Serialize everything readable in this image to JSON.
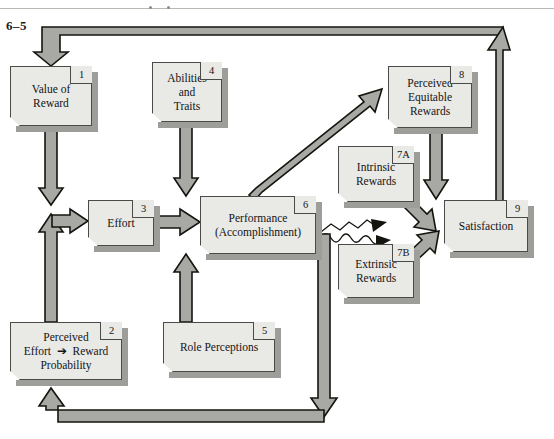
{
  "figure": {
    "number": "6–5"
  },
  "nodes": [
    {
      "id": "n1",
      "num": "1",
      "label": "Value of\nReward",
      "x": 10,
      "y": 66,
      "w": 82,
      "h": 60
    },
    {
      "id": "n2",
      "num": "2",
      "label": "Perceived\nEffort ➔ Reward\nProbability",
      "x": 10,
      "y": 322,
      "w": 112,
      "h": 58
    },
    {
      "id": "n3",
      "num": "3",
      "label": "Effort",
      "x": 88,
      "y": 200,
      "w": 66,
      "h": 46
    },
    {
      "id": "n4",
      "num": "4",
      "label": "Abilities\nand\nTraits",
      "x": 152,
      "y": 62,
      "w": 70,
      "h": 60
    },
    {
      "id": "n5",
      "num": "5",
      "label": "Role Perceptions",
      "x": 163,
      "y": 322,
      "w": 112,
      "h": 50
    },
    {
      "id": "n6",
      "num": "6",
      "label": "Performance\n(Accomplishment)",
      "x": 200,
      "y": 196,
      "w": 116,
      "h": 58
    },
    {
      "id": "n7a",
      "num": "7A",
      "label": "Intrinsic\nRewards",
      "x": 338,
      "y": 146,
      "w": 76,
      "h": 56
    },
    {
      "id": "n7b",
      "num": "7B",
      "label": "Extrinsic\nRewards",
      "x": 338,
      "y": 244,
      "w": 76,
      "h": 54
    },
    {
      "id": "n8",
      "num": "8",
      "label": "Perceived\nEquitable\nRewards",
      "x": 388,
      "y": 66,
      "w": 84,
      "h": 62
    },
    {
      "id": "n9",
      "num": "9",
      "label": "Satisfaction",
      "x": 444,
      "y": 200,
      "w": 84,
      "h": 52
    }
  ],
  "connections": [
    {
      "from": "top-loop",
      "to": "n1",
      "style": "block-arrow",
      "kind": "feedback"
    },
    {
      "from": "n1",
      "to": "effort-junction",
      "style": "block-arrow"
    },
    {
      "from": "n2",
      "to": "effort-junction",
      "style": "block-arrow"
    },
    {
      "from": "effort-junction",
      "to": "n3",
      "style": "block-arrow"
    },
    {
      "from": "n3",
      "to": "n6",
      "style": "block-arrow"
    },
    {
      "from": "n4",
      "to": "n6",
      "style": "block-arrow"
    },
    {
      "from": "n5",
      "to": "n6",
      "style": "block-arrow"
    },
    {
      "from": "n6",
      "to": "n8",
      "style": "block-arrow-diagonal"
    },
    {
      "from": "n6",
      "to": "n7a",
      "style": "thin-zigzag-arrow"
    },
    {
      "from": "n6",
      "to": "n7b",
      "style": "thin-wavy-arrow"
    },
    {
      "from": "n7a",
      "to": "n9",
      "style": "block-arrow-diagonal"
    },
    {
      "from": "n7b",
      "to": "n9",
      "style": "block-arrow-diagonal"
    },
    {
      "from": "n8",
      "to": "n9",
      "style": "block-arrow"
    },
    {
      "from": "n9",
      "to": "n1",
      "style": "block-arrow",
      "kind": "feedback-top"
    },
    {
      "from": "n6",
      "to": "n2",
      "style": "block-arrow",
      "kind": "feedback-bottom"
    }
  ],
  "colors": {
    "box_fill": "#e9e9e6",
    "box_border": "#4a4a48",
    "box_shadow": "#9d9d99",
    "arrow_fill": "#a8a8a4",
    "arrow_outline": "#14140f",
    "page_bg": "#ffffff",
    "rule": "#b9b9b4"
  }
}
